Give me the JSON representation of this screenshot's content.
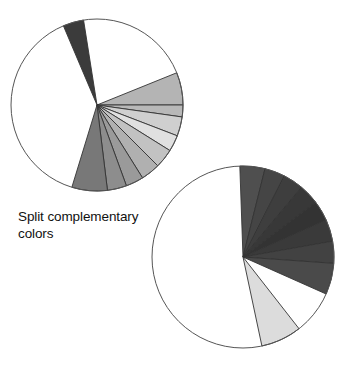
{
  "figure": {
    "title": "Split complementary colors",
    "caption": "Split complementary\ncolors",
    "background_color": "#ffffff",
    "outline_color": "#555555",
    "wedge_stroke_color": "#333333"
  },
  "chart_data": {
    "type": "pie",
    "title": "Split complementary colors",
    "xlabel": "",
    "ylabel": "",
    "charts": [
      {
        "name": "upper-left-wheel",
        "center_x": 97,
        "center_y": 105,
        "radius": 86,
        "outline": true,
        "categories": [
          "dark-accent",
          "light-gray-1",
          "light-gray-2",
          "light-gray-3",
          "light-gray-4",
          "mid-gray-1",
          "mid-gray-2",
          "mid-gray-3",
          "mid-gray-4",
          "white-remainder"
        ],
        "values": [
          14,
          30,
          12,
          11,
          13,
          13,
          12,
          13,
          24,
          198
        ],
        "start_angle": 247,
        "slices": [
          {
            "label": "dark-accent",
            "start": 247,
            "end": 261,
            "value": 14,
            "color": "#3b3b3b"
          },
          {
            "label": "white-gap",
            "start": 261,
            "end": 338,
            "value": 77,
            "color": "#ffffff"
          },
          {
            "label": "light-gray-1",
            "start": 338,
            "end": 360,
            "value": 22,
            "color": "#b4b4b4"
          },
          {
            "label": "light-gray-2",
            "start": 360,
            "end": 368,
            "value": 8,
            "color": "#b8b8b8"
          },
          {
            "label": "light-gray-3",
            "start": 368,
            "end": 381,
            "value": 13,
            "color": "#cfcfcf"
          },
          {
            "label": "light-gray-4",
            "start": 381,
            "end": 392,
            "value": 11,
            "color": "#e0e0e0"
          },
          {
            "label": "mid-gray-1",
            "start": 392,
            "end": 405,
            "value": 13,
            "color": "#c2c2c2"
          },
          {
            "label": "mid-gray-2",
            "start": 405,
            "end": 418,
            "value": 13,
            "color": "#b0b0b0"
          },
          {
            "label": "mid-gray-3",
            "start": 418,
            "end": 430,
            "value": 12,
            "color": "#9a9a9a"
          },
          {
            "label": "mid-gray-4",
            "start": 430,
            "end": 443,
            "value": 13,
            "color": "#8d8d8d"
          },
          {
            "label": "mid-gray-5",
            "start": 443,
            "end": 467,
            "value": 24,
            "color": "#787878"
          },
          {
            "label": "white-remainder",
            "start": 467,
            "end": 607,
            "value": 140,
            "color": "#ffffff"
          }
        ]
      },
      {
        "name": "lower-right-wheel",
        "center_x": 243,
        "center_y": 257,
        "radius": 91,
        "outline": true,
        "categories": [
          "dark-1",
          "dark-2",
          "dark-3",
          "dark-4",
          "dark-5",
          "dark-6",
          "dark-7",
          "dark-8",
          "light-accent",
          "white-remainder"
        ],
        "values": [
          16,
          13,
          13,
          13,
          13,
          14,
          14,
          20,
          26,
          198
        ],
        "start_angle": 268,
        "slices": [
          {
            "label": "dark-1",
            "start": 268,
            "end": 284,
            "value": 16,
            "color": "#4f4f4f"
          },
          {
            "label": "dark-2",
            "start": 284,
            "end": 297,
            "value": 13,
            "color": "#454545"
          },
          {
            "label": "dark-3",
            "start": 297,
            "end": 310,
            "value": 13,
            "color": "#3e3e3e"
          },
          {
            "label": "dark-4",
            "start": 310,
            "end": 323,
            "value": 13,
            "color": "#383838"
          },
          {
            "label": "dark-5",
            "start": 323,
            "end": 336,
            "value": 13,
            "color": "#333333"
          },
          {
            "label": "dark-6",
            "start": 336,
            "end": 350,
            "value": 14,
            "color": "#3a3a3a"
          },
          {
            "label": "dark-7",
            "start": 350,
            "end": 364,
            "value": 14,
            "color": "#424242"
          },
          {
            "label": "dark-8",
            "start": 364,
            "end": 384,
            "value": 20,
            "color": "#4a4a4a"
          },
          {
            "label": "white-gap",
            "start": 384,
            "end": 412,
            "value": 28,
            "color": "#ffffff"
          },
          {
            "label": "light-accent",
            "start": 412,
            "end": 438,
            "value": 26,
            "color": "#dcdcdc"
          },
          {
            "label": "white-remainder",
            "start": 438,
            "end": 628,
            "value": 190,
            "color": "#ffffff"
          }
        ]
      }
    ]
  }
}
